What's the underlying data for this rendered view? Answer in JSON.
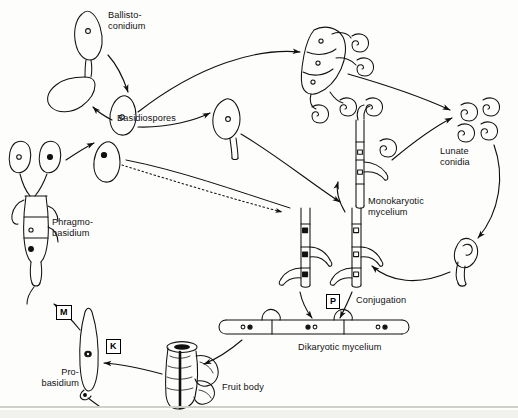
{
  "figure": {
    "background_color": "#fdfdfc",
    "ink_color": "#111111"
  },
  "labels": {
    "ballistoconidium": "Ballisto-\nconidium",
    "basidiospores": "Basidiospores",
    "lunate_conidia": "Lunate\nconidia",
    "monokaryotic_mycelium": "Monokaryotic\nmycelium",
    "conjugation": "Conjugation",
    "dikaryotic_mycelium": "Dikaryotic mycelium",
    "fruit_body": "Fruit body",
    "probasidium": "Pro-\nbasidium",
    "phragmobasidium": "Phragmo-\nbasidium"
  },
  "key_markers": {
    "meiosis": "M",
    "karyogamy": "K",
    "plasmogamy": "P"
  },
  "structures": [
    {
      "name": "ballistoconidium",
      "nucleus": "open"
    },
    {
      "name": "detached-ballistoconidium",
      "nucleus": "none"
    },
    {
      "name": "basidiospore-upper",
      "nucleus": "open"
    },
    {
      "name": "basidiospore-lower",
      "nucleus": "filled"
    },
    {
      "name": "germinating-basidiospore",
      "nucleus": "open"
    },
    {
      "name": "conidiophore-sporodochium",
      "nucleus": "open"
    },
    {
      "name": "lunate-conidia-cluster",
      "nucleus": "none"
    },
    {
      "name": "monokaryotic-mycelium-conidiogenous",
      "nucleus": "open"
    },
    {
      "name": "monokaryotic-mycelium-black",
      "nucleus": "filled"
    },
    {
      "name": "monokaryotic-mycelium-white",
      "nucleus": "open"
    },
    {
      "name": "dikaryotic-mycelium",
      "nucleus": "paired"
    },
    {
      "name": "fruit-body",
      "nucleus": "none"
    },
    {
      "name": "probasidium",
      "nucleus": "fused"
    },
    {
      "name": "phragmobasidium",
      "nucleus": "open-and-filled"
    },
    {
      "name": "germinating-lunate-conidium",
      "nucleus": "none"
    }
  ]
}
